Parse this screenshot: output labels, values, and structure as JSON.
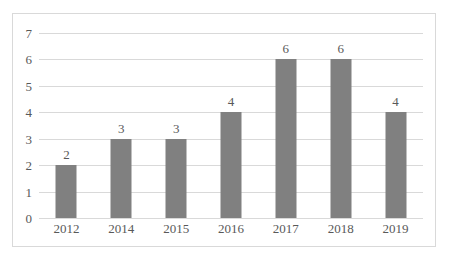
{
  "chart_data": {
    "type": "bar",
    "title": "",
    "subtitle": "",
    "xlabel": "",
    "ylabel": "",
    "categories": [
      "2012",
      "2014",
      "2015",
      "2016",
      "2017",
      "2018",
      "2019"
    ],
    "values": [
      2,
      3,
      3,
      4,
      6,
      6,
      4
    ],
    "data_labels": [
      "2",
      "3",
      "3",
      "4",
      "6",
      "6",
      "4"
    ],
    "ylim": [
      0,
      7
    ],
    "y_ticks": [
      0,
      1,
      2,
      3,
      4,
      5,
      6,
      7
    ],
    "y_tick_labels": [
      "0",
      "1",
      "2",
      "3",
      "4",
      "5",
      "6",
      "7"
    ],
    "grid": true,
    "grid_axis": "y",
    "legend": false,
    "legend_position": "none",
    "annotations": []
  },
  "style": {
    "bar_color": "#808080",
    "gridline_color": "#D9D9D9",
    "frame_border_color": "#D9D9D9",
    "text_color": "#595959",
    "plot_background": "#FFFFFF",
    "figure_background": "#FFFFFF"
  }
}
